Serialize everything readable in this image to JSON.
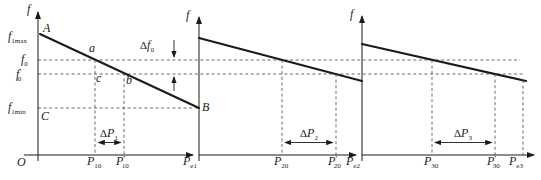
{
  "colors": {
    "ink": "#1b1b1b",
    "dash": "#454545",
    "bg": "#ffffff"
  },
  "plots": [
    {
      "axis_f": "f",
      "origin": "O",
      "point_A": "A",
      "point_a": "a",
      "point_b": "b",
      "point_c": "c",
      "point_B": "B",
      "point_C": "C",
      "f1max": {
        "base": "f",
        "sub": "1max"
      },
      "f0": {
        "base": "f",
        "sub": "0"
      },
      "f0_prime": {
        "base": "f",
        "prime": "′",
        "sub": "0"
      },
      "f1min": {
        "base": "f",
        "sub": "1min"
      },
      "x1": {
        "base": "P",
        "sub": "10"
      },
      "x2": {
        "base": "P",
        "prime": "′",
        "sub": "10"
      },
      "x3": {
        "base": "P",
        "sub": "e1"
      },
      "delta_f": {
        "delta": "Δ",
        "base": "f",
        "sub": "0"
      },
      "delta_p": {
        "delta": "Δ",
        "base": "P",
        "sub": "1"
      }
    },
    {
      "axis_f": "f",
      "x1": {
        "base": "P",
        "sub": "20"
      },
      "x2": {
        "base": "P",
        "prime": "′",
        "sub": "20"
      },
      "x3": {
        "base": "P",
        "sub": "e2"
      },
      "delta_p": {
        "delta": "Δ",
        "base": "P",
        "sub": "2"
      }
    },
    {
      "axis_f": "f",
      "x1": {
        "base": "P",
        "sub": "30"
      },
      "x2": {
        "base": "P",
        "prime": "′",
        "sub": "30"
      },
      "x3": {
        "base": "P",
        "sub": "e3"
      },
      "delta_p": {
        "delta": "Δ",
        "base": "P",
        "sub": "3"
      }
    }
  ]
}
